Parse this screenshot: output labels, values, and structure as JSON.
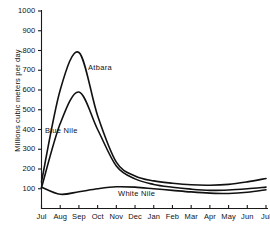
{
  "chart_data": {
    "type": "line",
    "title": "",
    "xlabel": "",
    "ylabel": "Millions cubic meters per day",
    "ylim": [
      0,
      1000
    ],
    "ytick_values": [
      100,
      200,
      300,
      400,
      500,
      600,
      700,
      800,
      900,
      1000
    ],
    "ytick_labels": [
      "100",
      "200",
      "300",
      "400",
      "500",
      "600",
      "700",
      "800",
      "900",
      "1000"
    ],
    "grid": false,
    "legend_position": "inline-annotations",
    "categories": [
      "Jul",
      "Aug",
      "Sep",
      "Oct",
      "Nov",
      "Dec",
      "Jan",
      "Feb",
      "Mar",
      "Apr",
      "May",
      "Jun",
      "Jul"
    ],
    "series": [
      {
        "name": "Atbara",
        "label_text": "Atbara",
        "values": [
          135,
          600,
          790,
          470,
          235,
          165,
          140,
          128,
          120,
          118,
          122,
          135,
          152
        ]
      },
      {
        "name": "Blue Nile",
        "label_text": "Blue Nile",
        "values": [
          105,
          430,
          590,
          400,
          215,
          150,
          122,
          108,
          98,
          92,
          94,
          100,
          108
        ]
      },
      {
        "name": "White Nile",
        "label_text": "White Nile",
        "values": [
          108,
          72,
          85,
          100,
          110,
          108,
          100,
          92,
          84,
          78,
          76,
          82,
          95
        ]
      }
    ]
  }
}
